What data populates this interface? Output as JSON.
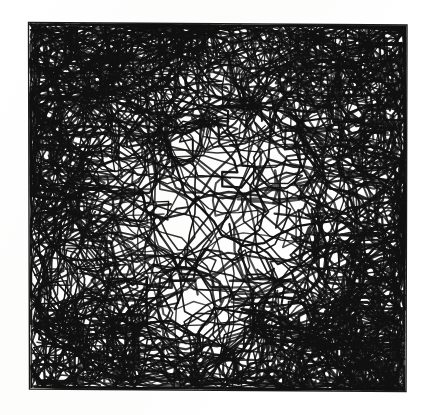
{
  "figure": {
    "kind": "scientific-figure-scan",
    "medium": "black-and-white scanned halftone line drawing",
    "caption": "",
    "canvas": {
      "width": 424,
      "height": 415
    },
    "background_color": "#ffffff",
    "ink_color": "#111111"
  },
  "plot_frame": {
    "label": "plot-border-rectangle",
    "visible": true,
    "stroke_color": "#1a1a1a",
    "stroke_width": 1.4,
    "fill": "none",
    "corners_px": {
      "top_left": [
        28.5,
        22.5
      ],
      "top_right": [
        407.0,
        25.0
      ],
      "bottom_right": [
        406.0,
        391.5
      ],
      "bottom_left": [
        29.5,
        389.0
      ]
    },
    "skew_note": "slightly rotated/trapezoidal from page scan"
  },
  "axes": {
    "tick_marks": false,
    "tick_labels": [],
    "x_axis_label": "",
    "y_axis_label": "",
    "title": "",
    "legend": {
      "visible": false,
      "entries": []
    },
    "gridlines": false
  },
  "chart_data": {
    "type": "line",
    "title": "",
    "subtitle": "",
    "xlabel": "",
    "ylabel": "",
    "xlim": [
      0,
      1
    ],
    "ylim": [
      0,
      1
    ],
    "grid": false,
    "legend_position": "none",
    "series_count": 150,
    "points_per_series": 34,
    "stroke_color": "#111111",
    "stroke_width_px": 1.6,
    "density_map": {
      "note": "Relative ink density sampled on a 4x4 grid over the plot box, 0 = white, 1 = solid black.",
      "grid_rows": 4,
      "grid_cols": 4,
      "values": [
        [
          0.95,
          0.8,
          0.72,
          0.88
        ],
        [
          0.7,
          0.48,
          0.36,
          0.6
        ],
        [
          0.62,
          0.4,
          0.26,
          0.58
        ],
        [
          0.82,
          0.55,
          0.5,
          0.86
        ]
      ]
    },
    "edge_accumulation": {
      "top_band": 0.93,
      "left_band": 0.78,
      "right_band": 0.8,
      "bottom_band": 0.72
    },
    "hotspots": [
      {
        "name": "top-left-corner",
        "cx": 0.12,
        "cy": 0.09,
        "radius": 0.17,
        "intensity": 1.0
      },
      {
        "name": "top-centre-band",
        "cx": 0.47,
        "cy": 0.07,
        "radius": 0.22,
        "intensity": 0.88
      },
      {
        "name": "top-right-corner",
        "cx": 0.88,
        "cy": 0.1,
        "radius": 0.16,
        "intensity": 0.92
      },
      {
        "name": "right-upper-edge",
        "cx": 0.94,
        "cy": 0.33,
        "radius": 0.13,
        "intensity": 0.8
      },
      {
        "name": "left-mid-edge",
        "cx": 0.06,
        "cy": 0.47,
        "radius": 0.14,
        "intensity": 0.78
      },
      {
        "name": "bottom-left-corner",
        "cx": 0.13,
        "cy": 0.91,
        "radius": 0.17,
        "intensity": 0.9
      },
      {
        "name": "bottom-right-corner",
        "cx": 0.86,
        "cy": 0.9,
        "radius": 0.17,
        "intensity": 0.94
      },
      {
        "name": "right-lower-edge",
        "cx": 0.93,
        "cy": 0.66,
        "radius": 0.14,
        "intensity": 0.82
      }
    ],
    "open_regions": [
      {
        "name": "centre-void",
        "cx": 0.52,
        "cy": 0.52,
        "radius": 0.15
      },
      {
        "name": "centre-right-void",
        "cx": 0.7,
        "cy": 0.6,
        "radius": 0.13
      },
      {
        "name": "lower-centre-void",
        "cx": 0.45,
        "cy": 0.82,
        "radius": 0.12
      }
    ],
    "generator": {
      "model": "confined 2-D random walk, reflecting walls, wall-sticking bias",
      "seed": 20240711,
      "step_length_mean": 0.052,
      "step_length_jitter": 0.58,
      "turn_angle_sigma_rad": 0.85,
      "wall_bias": 0.36,
      "axis_aligned_fraction": 0.14
    }
  }
}
